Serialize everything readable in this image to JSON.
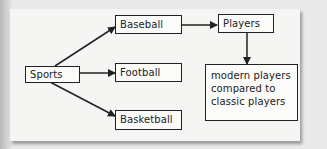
{
  "diagram": {
    "type": "flowchart",
    "nodes": [
      {
        "id": "sports",
        "label": "Sports"
      },
      {
        "id": "baseball",
        "label": "Baseball"
      },
      {
        "id": "football",
        "label": "Football"
      },
      {
        "id": "basketball",
        "label": "Basketball"
      },
      {
        "id": "players",
        "label": "Players"
      },
      {
        "id": "comparison",
        "label": "modern players compared to classic players"
      }
    ],
    "edges": [
      {
        "from": "sports",
        "to": "baseball"
      },
      {
        "from": "sports",
        "to": "football"
      },
      {
        "from": "sports",
        "to": "basketball"
      },
      {
        "from": "baseball",
        "to": "players"
      },
      {
        "from": "players",
        "to": "comparison"
      }
    ]
  },
  "colors": {
    "paper": "#f5f5f3",
    "line": "#222222"
  }
}
